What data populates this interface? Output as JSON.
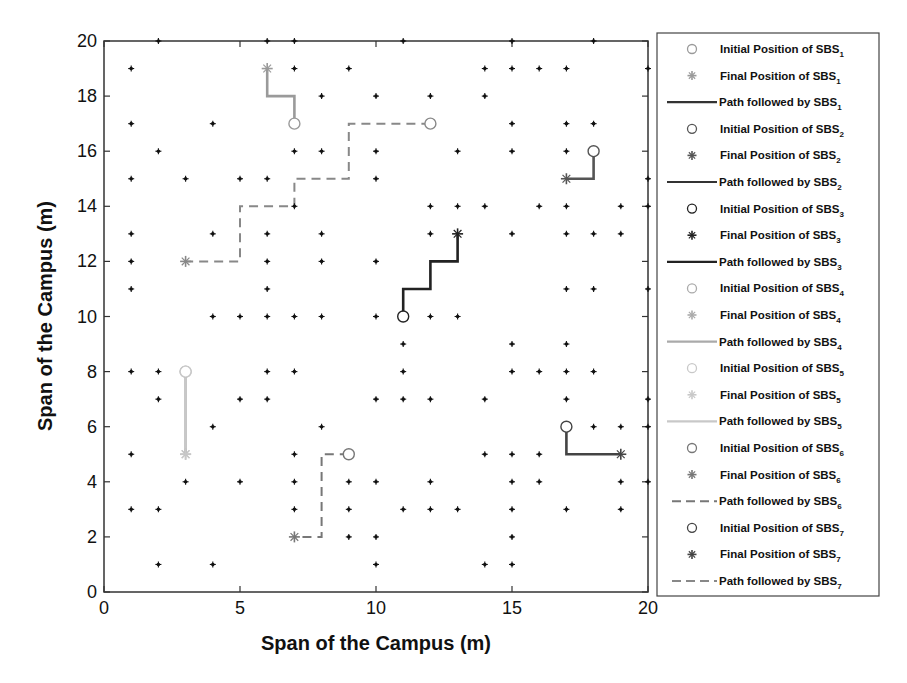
{
  "chart_data": {
    "type": "scatter",
    "title": "",
    "xlabel": "Span of the Campus (m)",
    "ylabel": "Span of the Campus (m)",
    "xlim": [
      0,
      20
    ],
    "ylim": [
      0,
      20
    ],
    "xticks": [
      0,
      5,
      10,
      15,
      20
    ],
    "yticks": [
      0,
      2,
      4,
      6,
      8,
      10,
      12,
      14,
      16,
      18,
      20
    ],
    "grid": false,
    "legend_position": "outside-right",
    "user_points": [
      [
        2,
        20
      ],
      [
        6,
        20
      ],
      [
        7,
        20
      ],
      [
        11,
        20
      ],
      [
        15,
        20
      ],
      [
        18,
        20
      ],
      [
        1,
        19
      ],
      [
        7,
        19
      ],
      [
        9,
        19
      ],
      [
        14,
        19
      ],
      [
        15,
        19
      ],
      [
        16,
        19
      ],
      [
        17,
        19
      ],
      [
        20,
        19
      ],
      [
        8,
        18
      ],
      [
        10,
        18
      ],
      [
        12,
        18
      ],
      [
        14,
        18
      ],
      [
        1,
        17
      ],
      [
        4,
        17
      ],
      [
        15,
        17
      ],
      [
        17,
        17
      ],
      [
        18,
        17
      ],
      [
        2,
        16
      ],
      [
        7,
        16
      ],
      [
        8,
        16
      ],
      [
        10,
        16
      ],
      [
        13,
        16
      ],
      [
        15,
        16
      ],
      [
        17,
        16
      ],
      [
        1,
        15
      ],
      [
        3,
        15
      ],
      [
        5,
        15
      ],
      [
        6,
        15
      ],
      [
        10,
        15
      ],
      [
        20,
        15
      ],
      [
        7,
        14
      ],
      [
        12,
        14
      ],
      [
        13,
        14
      ],
      [
        14,
        14
      ],
      [
        16,
        14
      ],
      [
        17,
        14
      ],
      [
        19,
        14
      ],
      [
        20,
        14
      ],
      [
        1,
        13
      ],
      [
        4,
        13
      ],
      [
        6,
        13
      ],
      [
        8,
        13
      ],
      [
        12,
        13
      ],
      [
        15,
        13
      ],
      [
        17,
        13
      ],
      [
        18,
        13
      ],
      [
        19,
        13
      ],
      [
        1,
        12
      ],
      [
        6,
        12
      ],
      [
        8,
        12
      ],
      [
        10,
        12
      ],
      [
        1,
        11
      ],
      [
        6,
        11
      ],
      [
        17,
        11
      ],
      [
        18,
        11
      ],
      [
        20,
        11
      ],
      [
        4,
        10
      ],
      [
        5,
        10
      ],
      [
        6,
        10
      ],
      [
        7,
        10
      ],
      [
        8,
        10
      ],
      [
        10,
        10
      ],
      [
        12,
        10
      ],
      [
        13,
        10
      ],
      [
        11,
        9
      ],
      [
        15,
        9
      ],
      [
        17,
        9
      ],
      [
        1,
        8
      ],
      [
        2,
        8
      ],
      [
        6,
        8
      ],
      [
        7,
        8
      ],
      [
        11,
        8
      ],
      [
        15,
        8
      ],
      [
        16,
        8
      ],
      [
        17,
        8
      ],
      [
        18,
        8
      ],
      [
        2,
        7
      ],
      [
        5,
        7
      ],
      [
        6,
        7
      ],
      [
        10,
        7
      ],
      [
        11,
        7
      ],
      [
        12,
        7
      ],
      [
        14,
        7
      ],
      [
        17,
        7
      ],
      [
        20,
        7
      ],
      [
        4,
        6
      ],
      [
        8,
        6
      ],
      [
        18,
        6
      ],
      [
        19,
        6
      ],
      [
        20,
        6
      ],
      [
        1,
        5
      ],
      [
        7,
        5
      ],
      [
        14,
        5
      ],
      [
        15,
        5
      ],
      [
        16,
        5
      ],
      [
        3,
        4
      ],
      [
        5,
        4
      ],
      [
        7,
        4
      ],
      [
        9,
        4
      ],
      [
        10,
        4
      ],
      [
        12,
        4
      ],
      [
        15,
        4
      ],
      [
        16,
        4
      ],
      [
        19,
        4
      ],
      [
        20,
        4
      ],
      [
        1,
        3
      ],
      [
        2,
        3
      ],
      [
        7,
        3
      ],
      [
        9,
        3
      ],
      [
        11,
        3
      ],
      [
        12,
        3
      ],
      [
        13,
        3
      ],
      [
        15,
        3
      ],
      [
        17,
        3
      ],
      [
        19,
        3
      ],
      [
        9,
        2
      ],
      [
        10,
        2
      ],
      [
        15,
        2
      ],
      [
        2,
        1
      ],
      [
        4,
        1
      ],
      [
        10,
        1
      ],
      [
        14,
        1
      ],
      [
        15,
        1
      ]
    ],
    "series": [
      {
        "name": "SBS1",
        "color": "#9a9a9a",
        "style": "solid",
        "initial": [
          7,
          17
        ],
        "final": [
          6,
          19
        ],
        "path": [
          [
            7,
            17
          ],
          [
            7,
            18
          ],
          [
            6,
            18
          ],
          [
            6,
            19
          ]
        ]
      },
      {
        "name": "SBS2",
        "color": "#555555",
        "style": "solid",
        "initial": [
          18,
          16
        ],
        "final": [
          17,
          15
        ],
        "path": [
          [
            18,
            16
          ],
          [
            18,
            15
          ],
          [
            17,
            15
          ]
        ]
      },
      {
        "name": "SBS3",
        "color": "#222222",
        "style": "solid",
        "initial": [
          11,
          10
        ],
        "final": [
          13,
          13
        ],
        "path": [
          [
            11,
            10
          ],
          [
            11,
            11
          ],
          [
            12,
            11
          ],
          [
            12,
            12
          ],
          [
            13,
            12
          ],
          [
            13,
            13
          ]
        ]
      },
      {
        "name": "SBS4",
        "color": "#b5b5b5",
        "style": "solid",
        "initial": [
          3,
          8
        ],
        "final": [
          3,
          5
        ],
        "path": [
          [
            3,
            8
          ],
          [
            3,
            5
          ]
        ]
      },
      {
        "name": "SBS5",
        "color": "#c8c8c8",
        "style": "solid",
        "initial": [
          3,
          8
        ],
        "final": [
          3,
          5
        ],
        "path": [
          [
            3,
            8
          ],
          [
            3,
            5
          ]
        ]
      },
      {
        "name": "SBS6",
        "color": "#777777",
        "style": "dashed",
        "initial": [
          9,
          5
        ],
        "final": [
          7,
          2
        ],
        "path": [
          [
            9,
            5
          ],
          [
            8,
            5
          ],
          [
            8,
            2
          ],
          [
            7,
            2
          ]
        ]
      },
      {
        "name": "SBS7",
        "color": "#888888",
        "style": "dashed",
        "initial": [
          12,
          17
        ],
        "final": [
          3,
          12
        ],
        "path": [
          [
            12,
            17
          ],
          [
            9,
            17
          ],
          [
            9,
            15
          ],
          [
            7,
            15
          ],
          [
            7,
            14
          ],
          [
            5,
            14
          ],
          [
            5,
            12
          ],
          [
            3,
            12
          ]
        ]
      },
      {
        "name": "SBS6b",
        "color": "#444444",
        "style": "solid",
        "initial": [
          17,
          6
        ],
        "final": [
          19,
          5
        ],
        "path": [
          [
            17,
            6
          ],
          [
            17,
            5
          ],
          [
            19,
            5
          ]
        ]
      }
    ]
  },
  "legend": {
    "items": [
      {
        "kind": "circle",
        "text": "Initial Position of SBS",
        "sub": "1",
        "color": "#9a9a9a"
      },
      {
        "kind": "star",
        "text": "Final Position of SBS",
        "sub": "1",
        "color": "#9a9a9a"
      },
      {
        "kind": "line",
        "text": "Path followed by SBS",
        "sub": "1",
        "color": "#333333"
      },
      {
        "kind": "circle",
        "text": "Initial Position of SBS",
        "sub": "2",
        "color": "#555555"
      },
      {
        "kind": "star",
        "text": "Final Position of SBS",
        "sub": "2",
        "color": "#555555"
      },
      {
        "kind": "line",
        "text": "Path followed by SBS",
        "sub": "2",
        "color": "#333333"
      },
      {
        "kind": "circle",
        "text": "Initial Position of SBS",
        "sub": "3",
        "color": "#222222"
      },
      {
        "kind": "star",
        "text": "Final Position of SBS",
        "sub": "3",
        "color": "#222222"
      },
      {
        "kind": "line",
        "text": "Path followed by SBS",
        "sub": "3",
        "color": "#222222"
      },
      {
        "kind": "circle",
        "text": "Initial Position of SBS",
        "sub": "4",
        "color": "#aaaaaa"
      },
      {
        "kind": "star",
        "text": "Final Position of SBS",
        "sub": "4",
        "color": "#aaaaaa"
      },
      {
        "kind": "line",
        "text": "Path followed by SBS",
        "sub": "4",
        "color": "#aaaaaa"
      },
      {
        "kind": "circle",
        "text": "Initial Position of SBS",
        "sub": "5",
        "color": "#c8c8c8"
      },
      {
        "kind": "star",
        "text": "Final Position of SBS",
        "sub": "5",
        "color": "#c8c8c8"
      },
      {
        "kind": "line",
        "text": "Path followed by SBS",
        "sub": "5",
        "color": "#c8c8c8"
      },
      {
        "kind": "circle",
        "text": "Initial Position of SBS",
        "sub": "6",
        "color": "#777777"
      },
      {
        "kind": "star",
        "text": "Final Position of SBS",
        "sub": "6",
        "color": "#777777"
      },
      {
        "kind": "dash",
        "text": "Path followed by SBS",
        "sub": "6",
        "color": "#777777"
      },
      {
        "kind": "circle",
        "text": "Initial Position of SBS",
        "sub": "7",
        "color": "#444444"
      },
      {
        "kind": "star",
        "text": "Final Position of SBS",
        "sub": "7",
        "color": "#444444"
      },
      {
        "kind": "dash",
        "text": "Path followed by SBS",
        "sub": "7",
        "color": "#888888"
      }
    ]
  }
}
